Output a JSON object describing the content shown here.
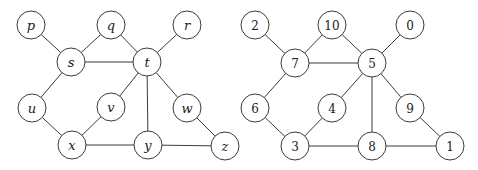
{
  "figure": {
    "background_color": "#ffffff",
    "stroke_color": "#3b3b3b",
    "label_color": "#1a1a1a",
    "node_fill": "#ffffff",
    "node_radius": 14
  },
  "graphs": [
    {
      "id": "left-graph",
      "name": "letter-labeled-graph",
      "label_style": "letter",
      "nodes": [
        {
          "id": "p",
          "label": "p",
          "cx": 31,
          "cy": 25
        },
        {
          "id": "q",
          "label": "q",
          "cx": 111,
          "cy": 25
        },
        {
          "id": "r",
          "label": "r",
          "cx": 187,
          "cy": 25
        },
        {
          "id": "s",
          "label": "s",
          "cx": 71,
          "cy": 62
        },
        {
          "id": "t",
          "label": "t",
          "cx": 147,
          "cy": 62
        },
        {
          "id": "u",
          "label": "u",
          "cx": 32,
          "cy": 108
        },
        {
          "id": "v",
          "label": "v",
          "cx": 111,
          "cy": 107
        },
        {
          "id": "w",
          "label": "w",
          "cx": 187,
          "cy": 108
        },
        {
          "id": "x",
          "label": "x",
          "cx": 72,
          "cy": 145
        },
        {
          "id": "y",
          "label": "y",
          "cx": 148,
          "cy": 145
        },
        {
          "id": "z",
          "label": "z",
          "cx": 225,
          "cy": 146
        }
      ],
      "edges": [
        [
          "p",
          "s"
        ],
        [
          "q",
          "s"
        ],
        [
          "q",
          "t"
        ],
        [
          "r",
          "t"
        ],
        [
          "s",
          "t"
        ],
        [
          "s",
          "u"
        ],
        [
          "t",
          "v"
        ],
        [
          "t",
          "w"
        ],
        [
          "t",
          "y"
        ],
        [
          "u",
          "x"
        ],
        [
          "v",
          "x"
        ],
        [
          "w",
          "z"
        ],
        [
          "x",
          "y"
        ],
        [
          "y",
          "z"
        ]
      ]
    },
    {
      "id": "right-graph",
      "name": "number-labeled-graph",
      "label_style": "digit",
      "nodes": [
        {
          "id": "2",
          "label": "2",
          "cx": 255,
          "cy": 25
        },
        {
          "id": "10",
          "label": "10",
          "cx": 332,
          "cy": 25
        },
        {
          "id": "0",
          "label": "0",
          "cx": 410,
          "cy": 25
        },
        {
          "id": "7",
          "label": "7",
          "cx": 295,
          "cy": 63
        },
        {
          "id": "5",
          "label": "5",
          "cx": 372,
          "cy": 63
        },
        {
          "id": "6",
          "label": "6",
          "cx": 255,
          "cy": 108
        },
        {
          "id": "4",
          "label": "4",
          "cx": 332,
          "cy": 108
        },
        {
          "id": "9",
          "label": "9",
          "cx": 410,
          "cy": 108
        },
        {
          "id": "3",
          "label": "3",
          "cx": 295,
          "cy": 146
        },
        {
          "id": "8",
          "label": "8",
          "cx": 372,
          "cy": 146
        },
        {
          "id": "1",
          "label": "1",
          "cx": 450,
          "cy": 146
        }
      ],
      "edges": [
        [
          "2",
          "7"
        ],
        [
          "10",
          "7"
        ],
        [
          "10",
          "5"
        ],
        [
          "0",
          "5"
        ],
        [
          "7",
          "5"
        ],
        [
          "7",
          "6"
        ],
        [
          "5",
          "4"
        ],
        [
          "5",
          "9"
        ],
        [
          "5",
          "8"
        ],
        [
          "6",
          "3"
        ],
        [
          "4",
          "3"
        ],
        [
          "9",
          "1"
        ],
        [
          "3",
          "8"
        ],
        [
          "8",
          "1"
        ]
      ]
    }
  ]
}
